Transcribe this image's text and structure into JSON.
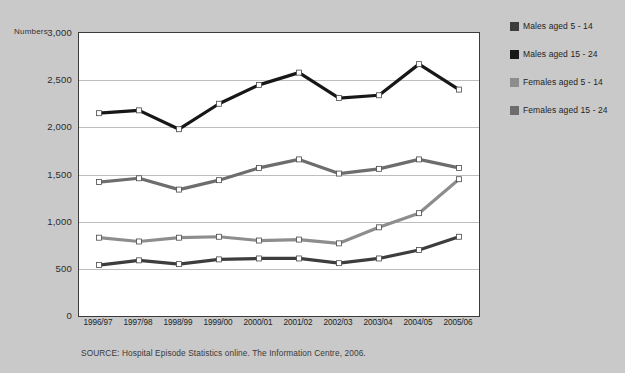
{
  "figure": {
    "background_color": "#c9c9c9",
    "plot_background_color": "#ffffff",
    "title_partial": "",
    "source_note": "SOURCE: Hospital Episode Statistics online. The Information Centre, 2006."
  },
  "axis": {
    "y_axis_name": "Numbers",
    "y_ticks": [
      "0",
      "500",
      "1,000",
      "1,500",
      "2,000",
      "2,500",
      "3,000"
    ],
    "y_tick_values": [
      0,
      500,
      1000,
      1500,
      2000,
      2500,
      3000
    ]
  },
  "legend": {
    "position": "right",
    "entries": [
      {
        "label": "Males aged 5 - 14",
        "color": "#3d3d3d"
      },
      {
        "label": "Males aged 15 - 24",
        "color": "#171717"
      },
      {
        "label": "Females aged 5 - 14",
        "color": "#8d8d8d"
      },
      {
        "label": "Females aged 15 - 24",
        "color": "#6d6d6d"
      }
    ]
  },
  "chart_data": {
    "type": "line",
    "title": "",
    "xlabel": "",
    "ylabel": "Numbers",
    "ylim": [
      0,
      3000
    ],
    "ytick_step": 500,
    "grid": true,
    "legend_position": "right",
    "marker": "square",
    "categories": [
      "1996/97",
      "1997/98",
      "1998/99",
      "1999/00",
      "2000/01",
      "2001/02",
      "2002/03",
      "2003/04",
      "2004/05",
      "2005/06"
    ],
    "series": [
      {
        "name": "Males aged 15 - 24",
        "color": "#171717",
        "values": [
          2150,
          2180,
          1980,
          2250,
          2450,
          2580,
          2310,
          2340,
          2670,
          2400
        ]
      },
      {
        "name": "Females aged 15 - 24",
        "color": "#6d6d6d",
        "values": [
          1420,
          1460,
          1340,
          1440,
          1570,
          1660,
          1510,
          1560,
          1660,
          1570
        ]
      },
      {
        "name": "Females aged 5 - 14",
        "color": "#8d8d8d",
        "values": [
          830,
          790,
          830,
          840,
          800,
          810,
          770,
          940,
          1090,
          1450
        ]
      },
      {
        "name": "Males aged 5 - 14",
        "color": "#3d3d3d",
        "values": [
          540,
          590,
          550,
          600,
          610,
          610,
          560,
          610,
          700,
          840
        ]
      }
    ]
  }
}
